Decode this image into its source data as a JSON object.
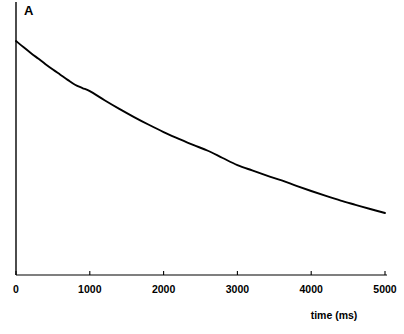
{
  "chart_data": {
    "type": "line",
    "title": "",
    "panel_label": "A",
    "xlabel": "time (ms)",
    "ylabel": "",
    "xlim": [
      0,
      5000
    ],
    "ylim": [
      0,
      1.0
    ],
    "grid": false,
    "legend": null,
    "x_ticks": [
      0,
      1000,
      2000,
      3000,
      4000,
      5000
    ],
    "x_tick_labels": [
      "0",
      "1000",
      "2000",
      "3000",
      "4000",
      "5000"
    ],
    "y_ticks": [],
    "y_tick_labels": [],
    "series": [
      {
        "name": "decay",
        "color": "#000000",
        "x": [
          0,
          100,
          200,
          300,
          400,
          500,
          600,
          700,
          800,
          900,
          1000,
          1200,
          1400,
          1600,
          1800,
          2000,
          2200,
          2400,
          2600,
          2800,
          3000,
          3200,
          3400,
          3600,
          3800,
          4000,
          4200,
          4400,
          4600,
          4800,
          5000
        ],
        "values": [
          1.0,
          0.974,
          0.949,
          0.925,
          0.901,
          0.878,
          0.856,
          0.834,
          0.813,
          0.799,
          0.786,
          0.747,
          0.71,
          0.675,
          0.642,
          0.611,
          0.583,
          0.556,
          0.531,
          0.5,
          0.47,
          0.447,
          0.425,
          0.404,
          0.381,
          0.359,
          0.338,
          0.318,
          0.3,
          0.282,
          0.265
        ]
      }
    ],
    "axis_colors": {
      "axis_line": "#000000",
      "curve": "#000000",
      "background": "#ffffff"
    }
  },
  "geometry": {
    "x_axis_y": 275,
    "y_axis_x": 16,
    "x_axis_right": 387,
    "y_axis_top": 2,
    "curve_top_y": 41
  }
}
